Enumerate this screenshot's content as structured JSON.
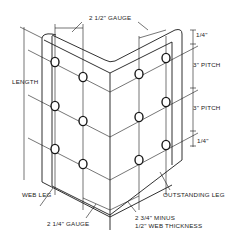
{
  "diagram": {
    "labels": {
      "top_gauge": "2 1/2\" GAUGE",
      "length": "LENGTH",
      "top_edge": "1/4\"",
      "pitch_1": "3\"  PITCH",
      "pitch_2": "3\"  PITCH",
      "bottom_edge": "1/4\"",
      "web_leg": "WEB LEG",
      "outstanding_leg": "OUTSTANDING LEG",
      "bottom_gauge": "2 1/4\" GAUGE",
      "outstanding_gauge_line1": "2 3/4\" MINUS",
      "outstanding_gauge_line2": "1/2\" WEB THICKNESS"
    },
    "bolt_holes": {
      "web_leg_count": 6,
      "outstanding_leg_count": 6,
      "rows": 3
    },
    "colors": {
      "ink": "#1a1a1a",
      "background": "#ffffff"
    }
  }
}
